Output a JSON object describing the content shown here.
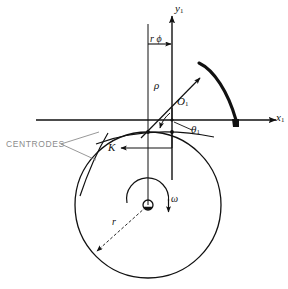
{
  "figure": {
    "type": "engineering-line-diagram",
    "background_color": "#ffffff",
    "line_color": "#111111"
  },
  "axes": {
    "x_axis": {
      "label": "x",
      "subscript": "1",
      "y_px": 120,
      "x_start": 36,
      "x_end": 284,
      "arrow": "right"
    },
    "y_axis": {
      "label": "y",
      "subscript": "1",
      "x_px": 172,
      "y_start": 14,
      "y_end": 180,
      "arrow": "up"
    },
    "origin_px": {
      "x": 172,
      "y": 120
    }
  },
  "labels": {
    "y_axis_label": "y",
    "y_axis_sub": "1",
    "x_axis_label": "x",
    "x_axis_sub": "1",
    "r_phi": "r ϕ",
    "rho": "ρ",
    "origin_point": "O",
    "origin_point_sub": "1",
    "theta": "θ",
    "theta_sub": "1",
    "centrodes": "CENTRODES",
    "contact_point": "K",
    "omega": "ω",
    "radius": "r"
  },
  "geometry": {
    "rolling_circle": {
      "center_x": 148,
      "center_y": 205,
      "radius": 73
    },
    "hub": {
      "center_x": 148,
      "center_y": 205,
      "radius": 5
    },
    "contact_point_K_px": {
      "x": 148,
      "y": 132
    },
    "vertical_reference_line_x": 148,
    "r_phi_dimension": {
      "from_x": 148,
      "to_x": 172,
      "y": 44
    },
    "rho_vector": {
      "from_x": 148,
      "from_y": 132,
      "to_x": 200,
      "to_y": 80
    },
    "trochoid_curve": {
      "start_x": 198,
      "start_y": 62,
      "end_x": 238,
      "end_y": 124
    },
    "omega_direction": "clockwise",
    "radius_line": {
      "from_x": 148,
      "from_y": 205,
      "to_x": 95,
      "to_y": 253
    }
  },
  "annotations": [
    {
      "name": "centrodes-leader",
      "points_to": [
        "fixed-centrode-arc",
        "moving-centrode-arc"
      ]
    },
    {
      "name": "K-leader",
      "points_to": "contact-point-K"
    }
  ]
}
